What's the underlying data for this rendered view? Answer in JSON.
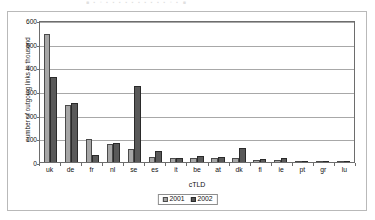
{
  "figure": {
    "top_cropped_caption": "■  ▪  ▫ ▪   ▪ ▪ ▪ ▪  ▪  ▪  ▪  ▪ ▪  ▫ ▪  ■"
  },
  "chart_data": {
    "type": "bar",
    "title": "",
    "xlabel": "cTLD",
    "ylabel": "number of outgoing links in thousand",
    "categories": [
      "uk",
      "de",
      "fr",
      "nl",
      "se",
      "es",
      "it",
      "be",
      "at",
      "dk",
      "fi",
      "ie",
      "pt",
      "gr",
      "lu"
    ],
    "series": [
      {
        "name": "2001",
        "color": "#a6a6a6",
        "values": [
          540,
          240,
          97,
          78,
          57,
          23,
          18,
          18,
          16,
          15,
          8,
          7,
          2,
          1,
          0
        ]
      },
      {
        "name": "2002",
        "color": "#595959",
        "values": [
          360,
          250,
          30,
          79,
          320,
          47,
          18,
          24,
          20,
          60,
          11,
          15,
          3,
          1,
          0
        ]
      }
    ],
    "ylim": [
      0,
      600
    ],
    "yticks": [
      0,
      100,
      200,
      300,
      400,
      500,
      600
    ],
    "ytick_labels": [
      "0",
      "100",
      "200",
      "300",
      "400",
      "500",
      "600"
    ],
    "grid": true,
    "legend_position": "bottom",
    "legend_entries": [
      "2001",
      "2002"
    ]
  }
}
